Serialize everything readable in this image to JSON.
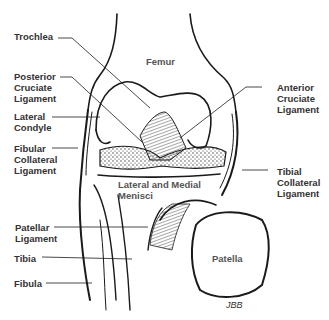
{
  "diagram": {
    "labels": {
      "trochlea": "Trochlea",
      "femur": "Femur",
      "posterior_cruciate": "Posterior\nCruciate\nLigament",
      "anterior_cruciate": "Anterior\nCruciate\nLigament",
      "lateral_condyle": "Lateral\nCondyle",
      "fibular_collateral": "Fibular\nCollateral\nLigament",
      "menisci": "Lateral and Medial\nMenisci",
      "tibial_collateral": "Tibial\nCollateral\nLigament",
      "patellar_ligament": "Patellar\nLigament",
      "tibia": "Tibia",
      "fibula": "Fibula",
      "patella": "Patella"
    },
    "signature": "JBB",
    "colors": {
      "ink": "#1a1a1a",
      "label": "#333333",
      "background": "#ffffff"
    }
  }
}
